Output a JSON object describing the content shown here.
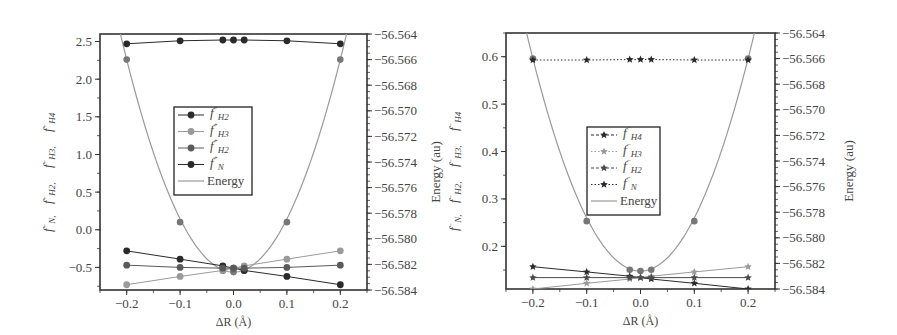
{
  "chart_data": [
    {
      "panel": "left",
      "type": "line",
      "xlabel": "ΔR (Å)",
      "ylabel": "f⁺N, f⁺H2, f⁺H3, f⁺H4",
      "y2label": "Energy (au)",
      "xlim": [
        -0.25,
        0.25
      ],
      "ylim": [
        -0.8,
        2.6
      ],
      "y2lim": [
        -56.584,
        -56.564
      ],
      "xticks": [
        "-0.2",
        "-0.1",
        "0.0",
        "0.1",
        "0.2"
      ],
      "yticks": [
        "-0.5",
        "0.0",
        "0.5",
        "1.0",
        "1.5",
        "2.0",
        "2.5"
      ],
      "y2ticks": [
        "-56.564",
        "-56.566",
        "-56.568",
        "-56.570",
        "-56.572",
        "-56.574",
        "-56.576",
        "-56.578",
        "-56.580",
        "-56.582",
        "-56.584"
      ],
      "x": [
        -0.2,
        -0.1,
        -0.02,
        0.0,
        0.02,
        0.1,
        0.2
      ],
      "marker": "circle",
      "legend": [
        "f⁺H2",
        "f⁺H3",
        "f⁺H2",
        "f⁺N",
        "Energy"
      ],
      "legend_position": "center",
      "series": [
        {
          "name": "f⁺N",
          "axis": "left",
          "color": "#2a2a2a",
          "values": [
            2.47,
            2.51,
            2.52,
            2.52,
            2.52,
            2.51,
            2.47
          ]
        },
        {
          "name": "f⁺H2",
          "axis": "left",
          "color": "#2a2a2a",
          "values": [
            -0.28,
            -0.39,
            -0.48,
            -0.51,
            -0.54,
            -0.62,
            -0.73
          ]
        },
        {
          "name": "f⁺H3",
          "axis": "left",
          "color": "#9a9a9a",
          "values": [
            -0.73,
            -0.62,
            -0.54,
            -0.51,
            -0.48,
            -0.39,
            -0.28
          ]
        },
        {
          "name": "f⁺H4",
          "axis": "left",
          "color": "#5a5a5a",
          "values": [
            -0.47,
            -0.5,
            -0.51,
            -0.51,
            -0.51,
            -0.5,
            -0.47
          ]
        },
        {
          "name": "Energy",
          "axis": "right",
          "color": "#9a9a9a",
          "values": [
            -56.566,
            -56.5787,
            -56.5825,
            -56.5826,
            -56.5825,
            -56.5787,
            -56.566
          ]
        }
      ]
    },
    {
      "panel": "right",
      "type": "line",
      "xlabel": "ΔR (Å)",
      "ylabel": "f⁻N, f⁻H2, f⁻H3, f⁻H4",
      "y2label": "Energy (au)",
      "xlim": [
        -0.25,
        0.25
      ],
      "ylim": [
        0.11,
        0.65
      ],
      "y2lim": [
        -56.584,
        -56.564
      ],
      "xticks": [
        "-0.2",
        "-0.1",
        "0.0",
        "0.1",
        "0.2"
      ],
      "yticks": [
        "0.2",
        "0.3",
        "0.4",
        "0.5",
        "0.6"
      ],
      "y2ticks": [
        "-56.564",
        "-56.566",
        "-56.568",
        "-56.570",
        "-56.572",
        "-56.574",
        "-56.576",
        "-56.578",
        "-56.580",
        "-56.582",
        "-56.584"
      ],
      "x": [
        -0.2,
        -0.1,
        -0.02,
        0.0,
        0.02,
        0.1,
        0.2
      ],
      "marker": "star",
      "legend": [
        "f⁻H4",
        "f⁻H3",
        "f⁻H2",
        "f⁻N",
        "Energy"
      ],
      "legend_position": "center",
      "series": [
        {
          "name": "f⁻N",
          "axis": "left",
          "color": "#2a2a2a",
          "dash": "dotted",
          "values": [
            0.593,
            0.593,
            0.594,
            0.594,
            0.594,
            0.593,
            0.593
          ]
        },
        {
          "name": "f⁻H4",
          "axis": "left",
          "color": "#2a2a2a",
          "values": [
            0.157,
            0.146,
            0.137,
            0.134,
            0.131,
            0.122,
            0.11
          ]
        },
        {
          "name": "f⁻H3",
          "axis": "left",
          "color": "#9a9a9a",
          "values": [
            0.11,
            0.122,
            0.131,
            0.134,
            0.137,
            0.146,
            0.157
          ]
        },
        {
          "name": "f⁻H2",
          "axis": "left",
          "color": "#4a4a4a",
          "values": [
            0.134,
            0.134,
            0.134,
            0.134,
            0.134,
            0.134,
            0.134
          ]
        },
        {
          "name": "Energy",
          "axis": "right",
          "color": "#9a9a9a",
          "values": [
            -56.566,
            -56.5787,
            -56.5825,
            -56.5826,
            -56.5825,
            -56.5787,
            -56.566
          ]
        }
      ]
    }
  ]
}
